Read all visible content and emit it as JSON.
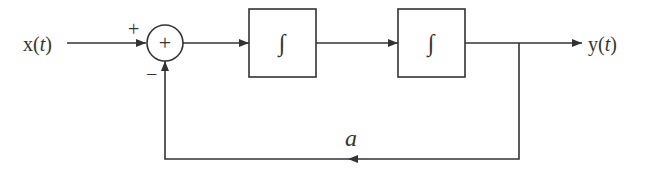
{
  "diagram": {
    "type": "block-diagram",
    "input": {
      "label": "x(",
      "var": "t",
      "close": ")"
    },
    "output": {
      "label": "y(",
      "var": "t",
      "close": ")"
    },
    "summer": {
      "symbol": "+",
      "input_sign_top": "+",
      "input_sign_bottom": "−"
    },
    "blocks": [
      {
        "id": "integrator-1",
        "symbol": "∫"
      },
      {
        "id": "integrator-2",
        "symbol": "∫"
      }
    ],
    "feedback": {
      "gain_label": "a"
    },
    "colors": {
      "stroke": "#333333",
      "background": "#ffffff"
    }
  }
}
